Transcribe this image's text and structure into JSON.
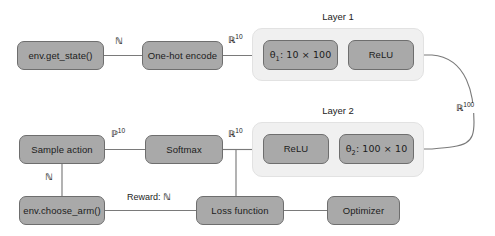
{
  "diagram": {
    "type": "flowchart",
    "canvas": {
      "width": 495,
      "height": 236
    },
    "colors": {
      "node_fill": "#a9a9a9",
      "node_stroke": "#6e6e6e",
      "group_fill": "#f0f0f0",
      "group_stroke": "#e2e2e2",
      "edge_stroke": "#7a7a7a",
      "text": "#1c1c1c",
      "background": "#ffffff"
    },
    "nodes": [
      {
        "id": "env_get_state",
        "label": "env.get_state()",
        "x": 17,
        "y": 41,
        "w": 87,
        "h": 29
      },
      {
        "id": "one_hot",
        "label": "One-hot encode",
        "x": 142,
        "y": 41,
        "w": 81,
        "h": 29
      },
      {
        "id": "theta1",
        "label": "θ₁: 10 × 100",
        "x": 263,
        "y": 40,
        "w": 75,
        "h": 30
      },
      {
        "id": "relu1",
        "label": "ReLU",
        "x": 348,
        "y": 40,
        "w": 66,
        "h": 30
      },
      {
        "id": "relu2",
        "label": "ReLU",
        "x": 263,
        "y": 134,
        "w": 66,
        "h": 30
      },
      {
        "id": "theta2",
        "label": "θ₂: 100 × 10",
        "x": 339,
        "y": 134,
        "w": 75,
        "h": 30
      },
      {
        "id": "sample_action",
        "label": "Sample action",
        "x": 19,
        "y": 135,
        "w": 86,
        "h": 29
      },
      {
        "id": "softmax",
        "label": "Softmax",
        "x": 145,
        "y": 135,
        "w": 78,
        "h": 29
      },
      {
        "id": "env_choose_arm",
        "label": "env.choose_arm()",
        "x": 19,
        "y": 196,
        "w": 86,
        "h": 29
      },
      {
        "id": "loss_function",
        "label": "Loss function",
        "x": 196,
        "y": 196,
        "w": 88,
        "h": 29
      },
      {
        "id": "optimizer",
        "label": "Optimizer",
        "x": 327,
        "y": 196,
        "w": 73,
        "h": 29
      }
    ],
    "groups": [
      {
        "id": "layer1",
        "label": "Layer 1",
        "x": 252,
        "y": 28,
        "w": 172,
        "h": 53,
        "label_x": 252,
        "label_y": 13,
        "label_w": 172
      },
      {
        "id": "layer2",
        "label": "Layer 2",
        "x": 252,
        "y": 122,
        "w": 172,
        "h": 55,
        "label_x": 252,
        "label_y": 106,
        "label_w": 172
      }
    ],
    "edge_labels": [
      {
        "id": "label_state_nat",
        "text_html": "<span class=\"bb\">ℕ</span>",
        "plain": "ℕ",
        "x": 114,
        "y": 37
      },
      {
        "id": "label_onehot_r10",
        "text_html": "<span class=\"bb\">ℝ</span><span class=\"sup\">10</span>",
        "plain": "ℝ10",
        "x": 228,
        "y": 36
      },
      {
        "id": "label_loop_r100",
        "text_html": "<span class=\"bb\">ℝ</span><span class=\"sup\">100</span>",
        "plain": "ℝ100",
        "x": 455,
        "y": 102
      },
      {
        "id": "label_softmax_r10",
        "text_html": "<span class=\"bb\">ℝ</span><span class=\"sup\">10</span>",
        "plain": "ℝ10",
        "x": 228,
        "y": 130
      },
      {
        "id": "label_sample_p10",
        "text_html": "<span class=\"bb\">ℙ</span><span class=\"sup\">10</span>",
        "plain": "ℙ10",
        "x": 111,
        "y": 130
      },
      {
        "id": "label_action_nat",
        "text_html": "<span class=\"bb\">ℕ</span>",
        "plain": "ℕ",
        "x": 44,
        "y": 172
      },
      {
        "id": "label_reward_nat",
        "text_html": "Reward: <span class=\"bb\">ℕ</span>",
        "plain": "Reward: ℕ",
        "x": 127,
        "y": 191
      }
    ],
    "edges": [
      {
        "from": "env_get_state",
        "to": "one_hot",
        "label": "ℕ"
      },
      {
        "from": "one_hot",
        "to": "theta1",
        "label": "ℝ10"
      },
      {
        "from": "theta1",
        "to": "relu1",
        "label": ""
      },
      {
        "from": "relu1",
        "to": "relu2",
        "label": "ℝ100"
      },
      {
        "from": "relu2",
        "to": "theta2",
        "label": ""
      },
      {
        "from": "theta2",
        "to": "softmax",
        "label": "ℝ10"
      },
      {
        "from": "softmax",
        "to": "sample_action",
        "label": "ℙ10"
      },
      {
        "from": "sample_action",
        "to": "env_choose_arm",
        "label": "ℕ"
      },
      {
        "from": "env_choose_arm",
        "to": "loss_function",
        "label": "Reward: ℕ"
      },
      {
        "from": "softmax",
        "to": "loss_function",
        "label": ""
      },
      {
        "from": "loss_function",
        "to": "optimizer",
        "label": ""
      }
    ]
  }
}
